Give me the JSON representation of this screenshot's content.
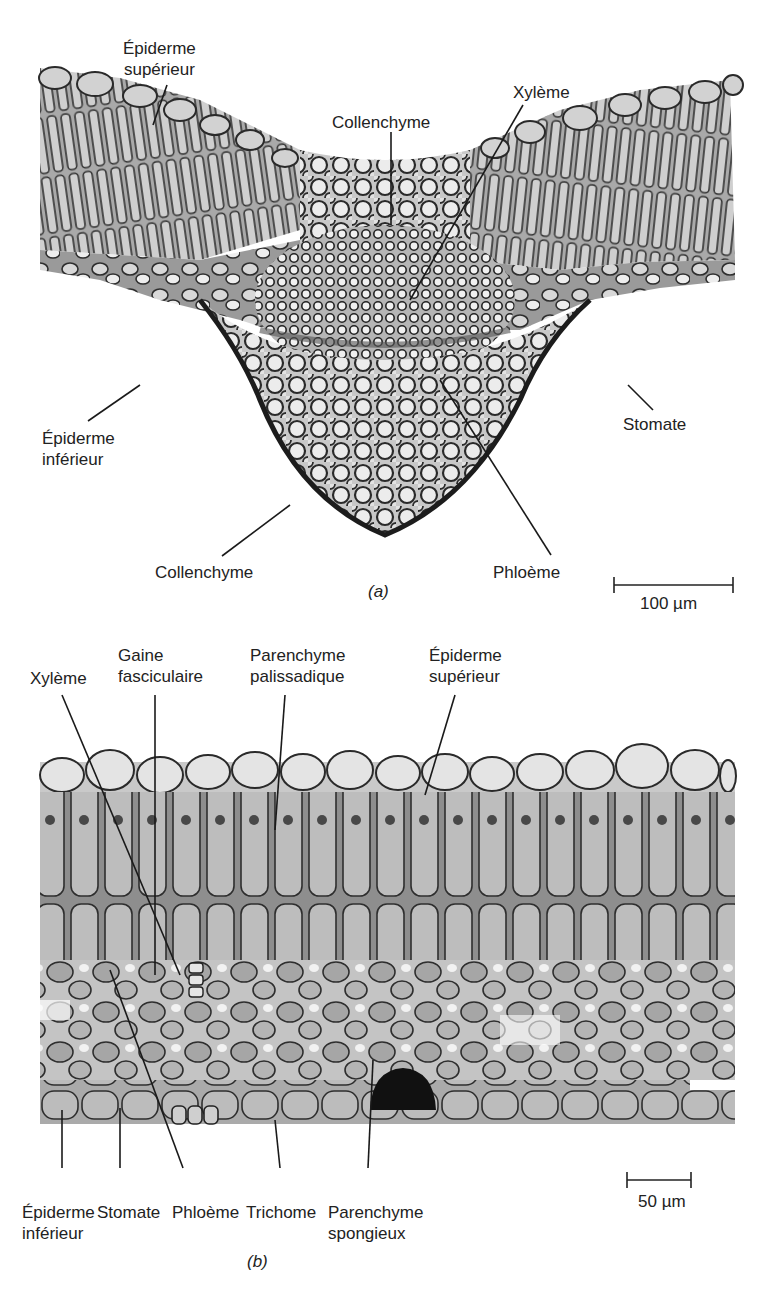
{
  "figure": {
    "panels": [
      {
        "id": "a",
        "tag": "(a)",
        "description": "Cross-section through leaf midrib",
        "scale_bar": "100 µm",
        "labels": {
          "epiderme_superieur_l1": "Épiderme",
          "epiderme_superieur_l2": "supérieur",
          "collenchyme_top": "Collenchyme",
          "xyleme": "Xylème",
          "epiderme_inferieur_l1": "Épiderme",
          "epiderme_inferieur_l2": "inférieur",
          "stomate": "Stomate",
          "collenchyme_bottom": "Collenchyme",
          "phloeme": "Phloème"
        }
      },
      {
        "id": "b",
        "tag": "(b)",
        "description": "Cross-section through leaf blade",
        "scale_bar": "50 µm",
        "labels": {
          "xyleme": "Xylème",
          "gaine_l1": "Gaine",
          "gaine_l2": "fasciculaire",
          "palissadique_l1": "Parenchyme",
          "palissadique_l2": "palissadique",
          "epiderme_superieur_l1": "Épiderme",
          "epiderme_superieur_l2": "supérieur",
          "epiderme_inferieur_l1": "Épiderme",
          "epiderme_inferieur_l2": "inférieur",
          "stomate": "Stomate",
          "phloeme": "Phloème",
          "trichome": "Trichome",
          "spongieux_l1": "Parenchyme",
          "spongieux_l2": "spongieux"
        }
      }
    ],
    "caption_fragment": "Figure 34.30"
  }
}
